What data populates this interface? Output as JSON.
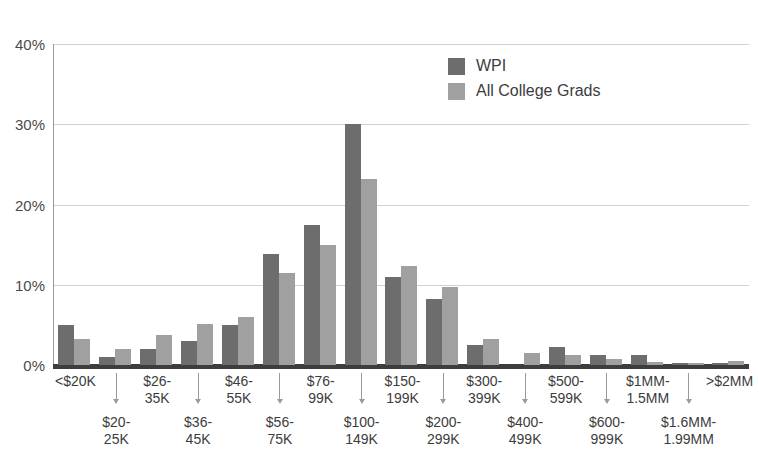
{
  "chart_data": {
    "type": "bar",
    "title": "",
    "xlabel": "",
    "ylabel": "",
    "ylim": [
      0,
      40
    ],
    "ytick_labels": [
      "0%",
      "10%",
      "20%",
      "30%",
      "40%"
    ],
    "ytick_values": [
      0,
      10,
      20,
      30,
      40
    ],
    "grid": true,
    "legend_position": "top-center",
    "categories": [
      "<$20K",
      "$20-25K",
      "$26-35K",
      "$36-45K",
      "$46-55K",
      "$56-75K",
      "$76-99K",
      "$100-149K",
      "$150-199K",
      "$200-299K",
      "$300-399K",
      "$400-499K",
      "$500-599K",
      "$600-999K",
      "$1MM-1.5MM",
      "$1.6MM-1.99MM",
      ">$2MM"
    ],
    "series": [
      {
        "name": "WPI",
        "color": "#6d6d6d",
        "values": [
          5.0,
          1.0,
          2.0,
          3.0,
          5.0,
          13.8,
          17.5,
          30.0,
          11.0,
          8.2,
          2.5,
          0.0,
          2.2,
          1.2,
          1.2,
          0.2,
          0.3
        ]
      },
      {
        "name": "All College Grads",
        "color": "#a0a0a0",
        "values": [
          3.3,
          2.0,
          3.7,
          5.1,
          6.0,
          11.5,
          15.0,
          23.2,
          12.4,
          9.7,
          3.3,
          1.5,
          1.2,
          0.8,
          0.4,
          0.2,
          0.5
        ]
      }
    ],
    "x_label_rows": [
      {
        "text": "<$20K",
        "row": "upper",
        "index": 0
      },
      {
        "text": "$20-\n25K",
        "row": "lower",
        "index": 1
      },
      {
        "text": "$26-\n35K",
        "row": "upper",
        "index": 2
      },
      {
        "text": "$36-\n45K",
        "row": "lower",
        "index": 3
      },
      {
        "text": "$46-\n55K",
        "row": "upper",
        "index": 4
      },
      {
        "text": "$56-\n75K",
        "row": "lower",
        "index": 5
      },
      {
        "text": "$76-\n99K",
        "row": "upper",
        "index": 6
      },
      {
        "text": "$100-\n149K",
        "row": "lower",
        "index": 7
      },
      {
        "text": "$150-\n199K",
        "row": "upper",
        "index": 8
      },
      {
        "text": "$200-\n299K",
        "row": "lower",
        "index": 9
      },
      {
        "text": "$300-\n399K",
        "row": "upper",
        "index": 10
      },
      {
        "text": "$400-\n499K",
        "row": "lower",
        "index": 11
      },
      {
        "text": "$500-\n599K",
        "row": "upper",
        "index": 12
      },
      {
        "text": "$600-\n999K",
        "row": "lower",
        "index": 13
      },
      {
        "text": "$1MM-\n1.5MM",
        "row": "upper",
        "index": 14
      },
      {
        "text": "$1.6MM-\n1.99MM",
        "row": "lower",
        "index": 15
      },
      {
        "text": ">$2MM",
        "row": "upper",
        "index": 16
      }
    ]
  },
  "legend": {
    "items": [
      {
        "label": "WPI",
        "color": "#6d6d6d"
      },
      {
        "label": "All College Grads",
        "color": "#a0a0a0"
      }
    ]
  },
  "colors": {
    "wpi": "#6d6d6d",
    "all_college_grads": "#a0a0a0",
    "gridline": "#d2d2d2",
    "axis": "#3d3d3d",
    "text": "#3c3c3c",
    "background": "#ffffff"
  }
}
